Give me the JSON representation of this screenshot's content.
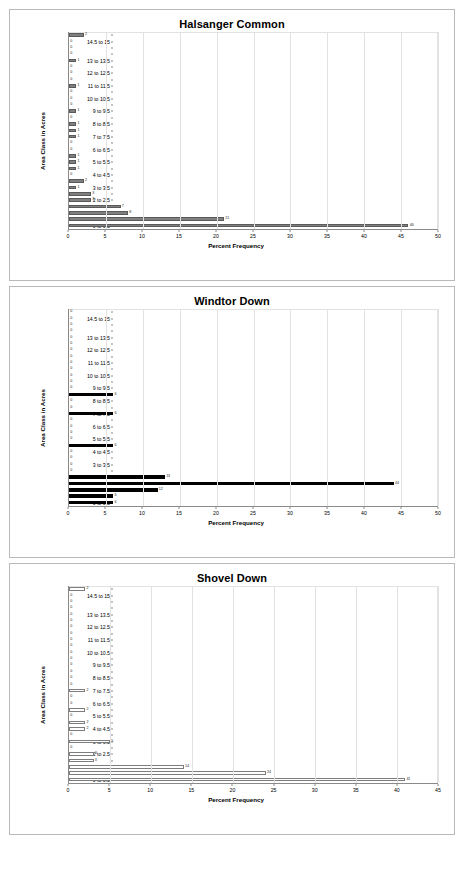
{
  "page": {
    "background": "#ffffff",
    "xlabel": "Percent Frequency",
    "ylabel": "Area Class in Acres"
  },
  "categories": [
    "0 to 0.5",
    "0.5 to 1",
    "1 to 1.5",
    "1.5 to 2",
    "2 to 2.5",
    "2.5 to 3",
    "3 to 3.5",
    "3.5 to 4",
    "4 to 4.5",
    "4.5 to 5",
    "5 to 5.5",
    "5.5 to 6",
    "6 to 6.5",
    "6.5 to 7",
    "7 to 7.5",
    "7.5 to 8",
    "8 to 8.5",
    "8.5 to 9",
    "9 to 9.5",
    "9.5 to 10",
    "10 to 10.5",
    "10.5 to 11",
    "11 to 11.5",
    "11.5 to 12",
    "12 to 12.5",
    "12.5 to 13",
    "13 to 13.5",
    "13.5 to 14",
    "14 to 14.5",
    "14.5 to 15",
    "15 to 15.5"
  ],
  "visible_ytick_labels": [
    "0 to 0.5",
    "1 to 1.5",
    "2 to 2.5",
    "3 to 3.5",
    "4 to 4.5",
    "5 to 5.5",
    "6 to 6.5",
    "7 to 7.5",
    "8 to 8.5",
    "9 to 9.5",
    "10 to 10.5",
    "11 to 11.5",
    "12 to 12.5",
    "13 to 13.5",
    "14.5 to 15"
  ],
  "chart_data": [
    {
      "type": "bar",
      "title": "Halsanger Common",
      "xlabel": "Percent Frequency",
      "ylabel": "Area Class in Acres",
      "orientation": "horizontal",
      "bar_style": "gray-filled",
      "bar_color": "#808080",
      "xlim": [
        0,
        50
      ],
      "xticks": [
        0,
        5,
        10,
        15,
        20,
        25,
        30,
        35,
        40,
        45,
        50
      ],
      "grid": true,
      "categories": [
        "0 to 0.5",
        "0.5 to 1",
        "1 to 1.5",
        "1.5 to 2",
        "2 to 2.5",
        "2.5 to 3",
        "3 to 3.5",
        "3.5 to 4",
        "4 to 4.5",
        "4.5 to 5",
        "5 to 5.5",
        "5.5 to 6",
        "6 to 6.5",
        "6.5 to 7",
        "7 to 7.5",
        "7.5 to 8",
        "8 to 8.5",
        "8.5 to 9",
        "9 to 9.5",
        "9.5 to 10",
        "10 to 10.5",
        "10.5 to 11",
        "11 to 11.5",
        "11.5 to 12",
        "12 to 12.5",
        "12.5 to 13",
        "13 to 13.5",
        "13.5 to 14",
        "14 to 14.5",
        "14.5 to 15",
        "15 to 15.5"
      ],
      "values": [
        46,
        21,
        8,
        7,
        3,
        3,
        1,
        2,
        0,
        1,
        1,
        1,
        0,
        0,
        1,
        1,
        1,
        0,
        1,
        0,
        0,
        0,
        1,
        0,
        0,
        0,
        1,
        0,
        0,
        0,
        2
      ],
      "labels": [
        "46",
        "21",
        "8",
        "7",
        "3",
        "3",
        "1",
        "2",
        "0",
        "1",
        "1",
        "1",
        "0",
        "0",
        "1",
        "1",
        "1",
        "0",
        "1",
        "0",
        "0",
        "0",
        "1",
        "0",
        "0",
        "0",
        "1",
        "0",
        "0",
        "0",
        "2"
      ]
    },
    {
      "type": "bar",
      "title": "Windtor Down",
      "xlabel": "Percent Frequency",
      "ylabel": "Area Class in Acres",
      "orientation": "horizontal",
      "bar_style": "black-filled",
      "bar_color": "#000000",
      "xlim": [
        0,
        50
      ],
      "xticks": [
        0,
        5,
        10,
        15,
        20,
        25,
        30,
        35,
        40,
        45,
        50
      ],
      "grid": true,
      "categories": [
        "0 to 0.5",
        "0.5 to 1",
        "1 to 1.5",
        "1.5 to 2",
        "2 to 2.5",
        "2.5 to 3",
        "3 to 3.5",
        "3.5 to 4",
        "4 to 4.5",
        "4.5 to 5",
        "5 to 5.5",
        "5.5 to 6",
        "6 to 6.5",
        "6.5 to 7",
        "7 to 7.5",
        "7.5 to 8",
        "8 to 8.5",
        "8.5 to 9",
        "9 to 9.5",
        "9.5 to 10",
        "10 to 10.5",
        "10.5 to 11",
        "11 to 11.5",
        "11.5 to 12",
        "12 to 12.5",
        "12.5 to 13",
        "13 to 13.5",
        "13.5 to 14",
        "14 to 14.5",
        "14.5 to 15",
        "15 to 15.5"
      ],
      "values": [
        6,
        6,
        12,
        44,
        13,
        0,
        0,
        0,
        0,
        6,
        0,
        0,
        0,
        0,
        6,
        0,
        0,
        6,
        0,
        0,
        0,
        0,
        0,
        0,
        0,
        0,
        0,
        0,
        0,
        0,
        0
      ],
      "labels": [
        "6",
        "6",
        "12",
        "44",
        "13",
        "0",
        "0",
        "0",
        "0",
        "6",
        "0",
        "0",
        "0",
        "0",
        "6",
        "0",
        "0",
        "6",
        "0",
        "0",
        "0",
        "0",
        "0",
        "0",
        "0",
        "0",
        "0",
        "0",
        "0",
        "0",
        "0"
      ]
    },
    {
      "type": "bar",
      "title": "Shovel Down",
      "xlabel": "Percent Frequency",
      "ylabel": "Area Class in Acres",
      "orientation": "horizontal",
      "bar_style": "white-outlined",
      "bar_color": "#ffffff",
      "bar_border_color": "#7d7d7d",
      "xlim": [
        0,
        45
      ],
      "xticks": [
        0,
        5,
        10,
        15,
        20,
        25,
        30,
        35,
        40,
        45
      ],
      "grid": true,
      "categories": [
        "0 to 0.5",
        "0.5 to 1",
        "1 to 1.5",
        "1.5 to 2",
        "2 to 2.5",
        "2.5 to 3",
        "3 to 3.5",
        "3.5 to 4",
        "4 to 4.5",
        "4.5 to 5",
        "5 to 5.5",
        "5.5 to 6",
        "6 to 6.5",
        "6.5 to 7",
        "7 to 7.5",
        "7.5 to 8",
        "8 to 8.5",
        "8.5 to 9",
        "9 to 9.5",
        "9.5 to 10",
        "10 to 10.5",
        "10.5 to 11",
        "11 to 11.5",
        "11.5 to 12",
        "12 to 12.5",
        "12.5 to 13",
        "13 to 13.5",
        "13.5 to 14",
        "14 to 14.5",
        "14.5 to 15",
        "15 to 15.5"
      ],
      "values": [
        41,
        24,
        14,
        3,
        3,
        0,
        5,
        0,
        2,
        2,
        0,
        2,
        0,
        0,
        2,
        0,
        0,
        0,
        0,
        0,
        0,
        0,
        0,
        0,
        0,
        0,
        0,
        0,
        0,
        0,
        2
      ],
      "labels": [
        "41",
        "24",
        "14",
        "3",
        "3",
        "0",
        "5",
        "0",
        "2",
        "2",
        "0",
        "2",
        "0",
        "0",
        "2",
        "0",
        "0",
        "0",
        "0",
        "0",
        "0",
        "0",
        "0",
        "0",
        "0",
        "0",
        "0",
        "0",
        "0",
        "0",
        "2"
      ]
    }
  ]
}
